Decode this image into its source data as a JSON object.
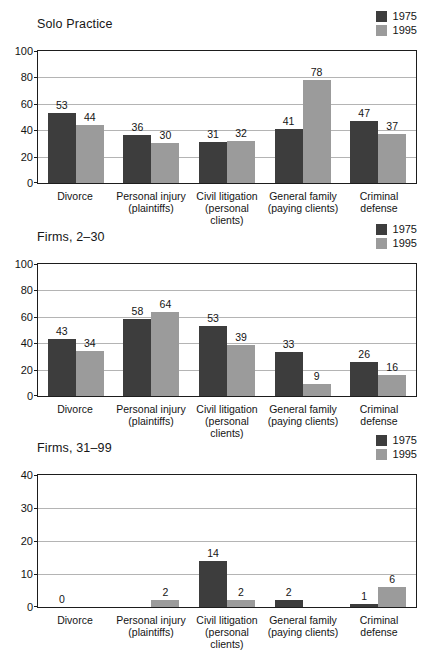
{
  "legend": {
    "entries": [
      {
        "label": "1975",
        "color": "#3d3d3d",
        "icon": "legend-swatch-dark"
      },
      {
        "label": "1995",
        "color": "#9b9b9b",
        "icon": "legend-swatch-light"
      }
    ]
  },
  "categories": [
    {
      "line1": "Divorce",
      "line2": ""
    },
    {
      "line1": "Personal injury",
      "line2": "(plaintiffs)"
    },
    {
      "line1": "Civil litigation",
      "line2": "(personal clients)"
    },
    {
      "line1": "General family",
      "line2": "(paying clients)"
    },
    {
      "line1": "Criminal",
      "line2": "defense"
    }
  ],
  "chart_data": [
    {
      "type": "bar",
      "title": "Solo Practice",
      "xlabel": "",
      "ylabel": "",
      "ylim": [
        0,
        100
      ],
      "yticks": [
        0,
        20,
        40,
        60,
        80,
        100
      ],
      "grid": true,
      "legend_position": "top-right",
      "categories": [
        "Divorce",
        "Personal injury (plaintiffs)",
        "Civil litigation (personal clients)",
        "General family (paying clients)",
        "Criminal defense"
      ],
      "series": [
        {
          "name": "1975",
          "color": "#3d3d3d",
          "values": [
            53,
            36,
            31,
            41,
            47
          ]
        },
        {
          "name": "1995",
          "color": "#9b9b9b",
          "values": [
            44,
            30,
            32,
            78,
            37
          ]
        }
      ]
    },
    {
      "type": "bar",
      "title": "Firms, 2–30",
      "xlabel": "",
      "ylabel": "",
      "ylim": [
        0,
        100
      ],
      "yticks": [
        0,
        20,
        40,
        60,
        80,
        100
      ],
      "grid": true,
      "legend_position": "top-right",
      "categories": [
        "Divorce",
        "Personal injury (plaintiffs)",
        "Civil litigation (personal clients)",
        "General family (paying clients)",
        "Criminal defense"
      ],
      "series": [
        {
          "name": "1975",
          "color": "#3d3d3d",
          "values": [
            43,
            58,
            53,
            33,
            26
          ]
        },
        {
          "name": "1995",
          "color": "#9b9b9b",
          "values": [
            34,
            64,
            39,
            9,
            16
          ]
        }
      ]
    },
    {
      "type": "bar",
      "title": "Firms, 31–99",
      "xlabel": "",
      "ylabel": "",
      "ylim": [
        0,
        40
      ],
      "yticks": [
        0,
        10,
        20,
        30,
        40
      ],
      "grid": true,
      "legend_position": "top-right",
      "categories": [
        "Divorce",
        "Personal injury (plaintiffs)",
        "Civil litigation (personal clients)",
        "General family (paying clients)",
        "Criminal defense"
      ],
      "series": [
        {
          "name": "1975",
          "color": "#3d3d3d",
          "values": [
            0,
            0,
            14,
            2,
            1
          ]
        },
        {
          "name": "1995",
          "color": "#9b9b9b",
          "values": [
            0,
            2,
            2,
            0,
            6
          ]
        }
      ],
      "value_labels": [
        {
          "category": "Divorce",
          "text": "0"
        },
        {
          "category": "Personal injury (plaintiffs)",
          "series": "1995",
          "text": "2"
        },
        {
          "category": "Civil litigation (personal clients)",
          "series": "1975",
          "text": "14"
        },
        {
          "category": "Civil litigation (personal clients)",
          "series": "1995",
          "text": "2"
        },
        {
          "category": "General family (paying clients)",
          "series": "1975",
          "text": "2"
        },
        {
          "category": "Criminal defense",
          "series": "1975",
          "text": "1"
        },
        {
          "category": "Criminal defense",
          "series": "1995",
          "text": "6"
        }
      ]
    }
  ]
}
